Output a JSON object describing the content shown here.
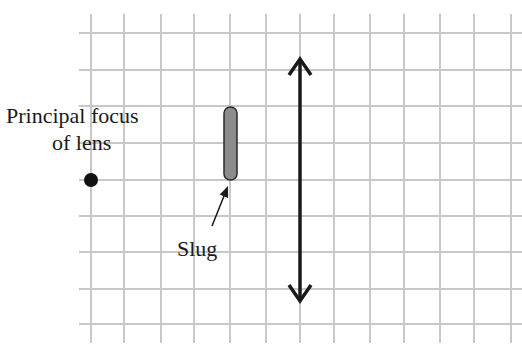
{
  "diagram": {
    "type": "ray-optics-setup",
    "labels": {
      "focus_line1": "Principal focus",
      "focus_line2": "of lens",
      "slug": "Slug"
    },
    "grid": {
      "color": "#c8c8c8",
      "vertical_x": [
        91,
        124,
        161,
        194,
        230,
        266,
        300,
        334,
        370,
        404,
        440,
        474,
        511
      ],
      "horizontal_y": [
        33,
        70,
        106,
        143,
        180,
        216,
        252,
        289,
        324
      ],
      "x_range": [
        79,
        522
      ],
      "y_range": [
        14,
        343
      ]
    },
    "lens": {
      "x": 300,
      "top_y": 59,
      "bottom_y": 301,
      "color": "#1a1a1a",
      "type": "converging"
    },
    "focus_point": {
      "x": 91,
      "y": 180,
      "r": 7,
      "color": "#111111"
    },
    "slug": {
      "x": 224,
      "y": 107,
      "width": 13,
      "height": 73,
      "fill": "#8c8c8c",
      "stroke": "#2a2a2a"
    },
    "slug_pointer": {
      "from": [
        212,
        226
      ],
      "to": [
        228,
        186
      ]
    }
  }
}
